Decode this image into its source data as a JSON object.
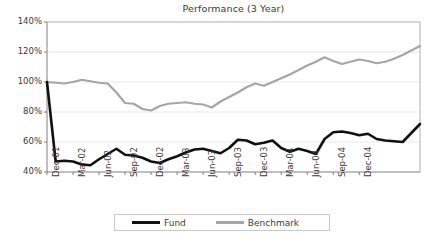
{
  "chart_data": {
    "type": "line",
    "title": "Performance (3 Year)",
    "xlabel": "",
    "ylabel": "",
    "ylim": [
      40,
      140
    ],
    "yticks": [
      40,
      60,
      80,
      100,
      120,
      140
    ],
    "ytick_labels": [
      "40%",
      "60%",
      "80%",
      "100%",
      "120%",
      "140%"
    ],
    "grid": true,
    "legend_position": "bottom",
    "categories": [
      "Dec-01",
      "Jan-02",
      "Feb-02",
      "Mar-02",
      "Apr-02",
      "May-02",
      "Jun-02",
      "Jul-02",
      "Aug-02",
      "Sep-02",
      "Oct-02",
      "Nov-02",
      "Dec-02",
      "Jan-03",
      "Feb-03",
      "Mar-03",
      "Apr-03",
      "May-03",
      "Jun-03",
      "Jul-03",
      "Aug-03",
      "Sep-03",
      "Oct-03",
      "Nov-03",
      "Dec-03",
      "Jan-04",
      "Feb-04",
      "Mar-04",
      "Apr-04",
      "May-04",
      "Jun-04",
      "Jul-04",
      "Aug-04",
      "Sep-04",
      "Oct-04",
      "Nov-04",
      "Dec-04"
    ],
    "xtick_labels": [
      "Dec-01",
      "Mar-02",
      "Jun-02",
      "Sep-02",
      "Dec-02",
      "Mar-03",
      "Jun-03",
      "Sep-03",
      "Dec-03",
      "Mar-04",
      "Jun-04",
      "Sep-04",
      "Dec-04"
    ],
    "series": [
      {
        "name": "Fund",
        "color": "#111111",
        "values": [
          100,
          47,
          47.5,
          47,
          45,
          44.5,
          48.5,
          52,
          55.5,
          51.5,
          51,
          49.5,
          47,
          46,
          48.5,
          50.5,
          53,
          55,
          55.5,
          54,
          52.5,
          56,
          61.5,
          61,
          58.5,
          59.5,
          61,
          56,
          53.5,
          55.5,
          54,
          52,
          62,
          66.5,
          67,
          66,
          64.5
        ]
      },
      {
        "name": "Benchmark",
        "color": "#a6a6a6",
        "values": [
          100,
          99.5,
          99,
          100,
          101.5,
          100.5,
          99.5,
          99,
          93,
          86,
          85.5,
          82,
          81,
          84,
          85.5,
          86,
          86.5,
          85.5,
          85,
          83,
          87,
          90,
          93,
          96.5,
          99,
          97.5,
          100,
          102.5,
          105,
          108,
          111,
          113.5,
          116.5,
          114,
          112,
          113.5,
          115
        ]
      }
    ],
    "series_tail": {
      "Fund": [
        64.5,
        65.5,
        62,
        61,
        60.5,
        60,
        66,
        72
      ],
      "Benchmark": [
        115,
        114,
        112.5,
        113.5,
        115.5,
        118,
        121,
        124
      ]
    }
  },
  "legend": {
    "items": [
      {
        "label": "Fund"
      },
      {
        "label": "Benchmark"
      }
    ]
  },
  "colors": {
    "fund": "#111111",
    "benchmark": "#a6a6a6",
    "axis": "#808080",
    "grid": "#e8e8e8",
    "background": "#ffffff"
  }
}
